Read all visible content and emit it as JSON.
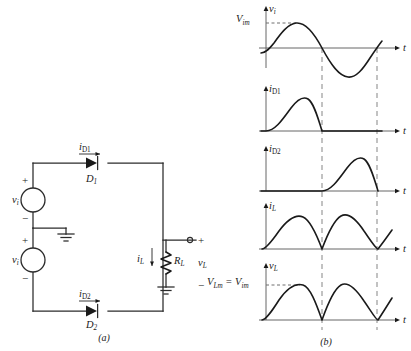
{
  "figure": {
    "panel_a_caption": "(a)",
    "panel_b_caption": "(b)"
  },
  "circuit": {
    "sources": [
      {
        "name": "source-top",
        "label": "v",
        "sub": "i",
        "plus": "+",
        "minus": "−"
      },
      {
        "name": "source-bottom",
        "label": "v",
        "sub": "i",
        "plus": "+",
        "minus": "−"
      }
    ],
    "diodes": [
      {
        "name": "diode-d1",
        "label": "D",
        "sub": "1",
        "current_label": "i",
        "current_sub": "D1"
      },
      {
        "name": "diode-d2",
        "label": "D",
        "sub": "2",
        "current_label": "i",
        "current_sub": "D2"
      }
    ],
    "load": {
      "resistor_label": "R",
      "resistor_sub": "L",
      "current_label": "i",
      "current_sub": "L",
      "voltage_label": "v",
      "voltage_sub": "L",
      "plus": "+",
      "minus": "−"
    },
    "ground_symbols": 3
  },
  "waveforms": [
    {
      "name": "vi",
      "y_label": "v",
      "y_sub": "i",
      "x_label": "t",
      "peak_label": "V",
      "peak_sub": "im",
      "peak_label_full": "Vᵢₘ",
      "type": "sine",
      "description": "Full sinusoid: positive half then negative half"
    },
    {
      "name": "iD1",
      "y_label": "i",
      "y_sub": "D1",
      "x_label": "t",
      "type": "half-wave-first",
      "description": "Positive half-sine during first half cycle, zero afterward"
    },
    {
      "name": "iD2",
      "y_label": "i",
      "y_sub": "D2",
      "x_label": "t",
      "type": "half-wave-second",
      "description": "Zero during first half cycle, positive half-sine during second half"
    },
    {
      "name": "iL",
      "y_label": "i",
      "y_sub": "L",
      "x_label": "t",
      "type": "full-wave-rectified",
      "description": "Full-wave rectified: successive positive humps"
    },
    {
      "name": "vL",
      "y_label": "v",
      "y_sub": "L",
      "x_label": "t",
      "type": "full-wave-rectified",
      "peak_equation": "Vₗₘ = Vᵢₘ",
      "peak_lhs": "V",
      "peak_lhs_sub": "Lm",
      "peak_eq": "=",
      "peak_rhs": "V",
      "peak_rhs_sub": "im",
      "description": "Full-wave rectified load voltage with peak equal to input peak"
    }
  ],
  "colors": {
    "ink": "#1a1a1a",
    "wire": "#2b2b2b",
    "axis": "#555555",
    "dashed_guide": "#9a9a9a",
    "background": "#ffffff"
  }
}
